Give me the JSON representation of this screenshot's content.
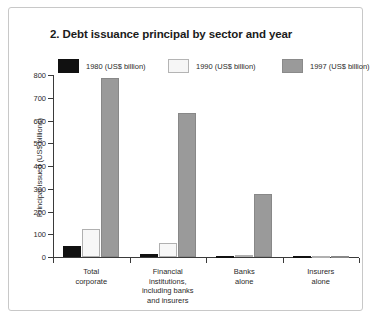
{
  "chart_data": {
    "type": "bar",
    "title": "2. Debt issuance principal by sector and year",
    "xlabel": "",
    "ylabel": "Principal issued (US$ billions)",
    "ylim": [
      0,
      800
    ],
    "yticks": [
      0,
      100,
      200,
      300,
      400,
      500,
      600,
      700,
      800
    ],
    "grid": false,
    "legend_position": "top",
    "categories": [
      "Total\ncorporate",
      "Financial\ninstitutions,\nincluding banks\nand insurers",
      "Banks\nalone",
      "Insurers\nalone"
    ],
    "series": [
      {
        "name": "1980 (US$ billion)",
        "color": "#111111",
        "values": [
          48,
          12,
          1,
          0
        ]
      },
      {
        "name": "1990 (US$ billion)",
        "color": "#f7f7f7",
        "values": [
          125,
          62,
          8,
          1
        ]
      },
      {
        "name": "1997 (US$ billion)",
        "color": "#9a9a9a",
        "values": [
          785,
          635,
          278,
          4
        ]
      }
    ]
  },
  "figure": {
    "title": "2. Debt issuance principal by sector and year",
    "y_axis_title": "Principal issued (US$ billions)",
    "y_tick_labels": [
      "800",
      "700",
      "600",
      "500",
      "400",
      "300",
      "200",
      "100",
      "0"
    ],
    "category_labels": [
      "Total corporate",
      "Financial institutions, including banks and insurers",
      "Banks alone",
      "Insurers alone"
    ],
    "category_lines": [
      [
        "Total",
        "corporate"
      ],
      [
        "Financial",
        "institutions,",
        "including banks",
        "and insurers"
      ],
      [
        "Banks",
        "alone"
      ],
      [
        "Insurers",
        "alone"
      ]
    ],
    "legend": [
      "1980 (US$ billion)",
      "1990 (US$ billion)",
      "1997 (US$ billion)"
    ]
  }
}
